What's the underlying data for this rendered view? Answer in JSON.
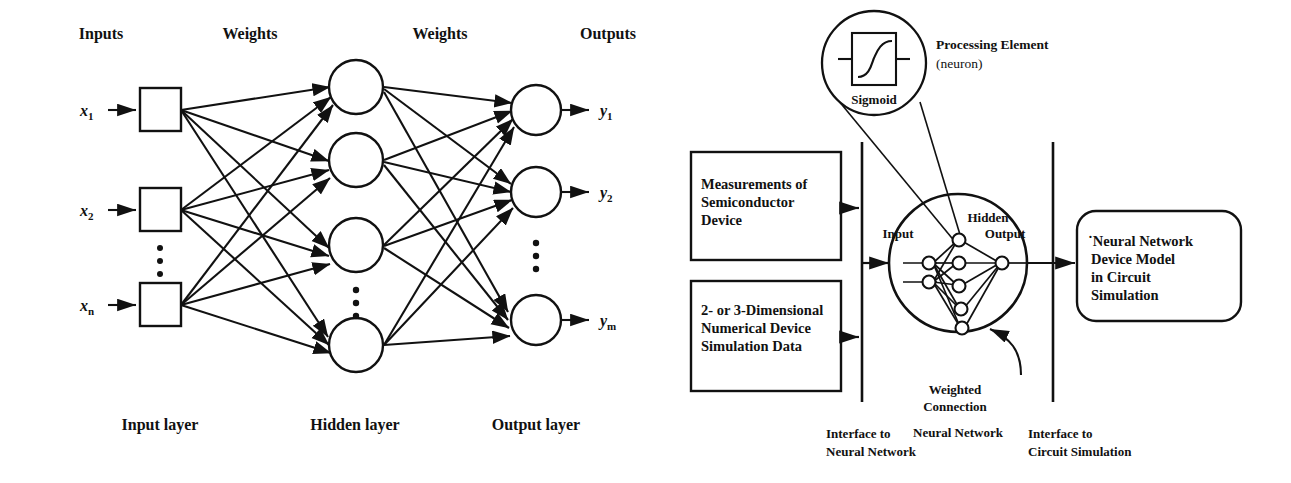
{
  "figure": {
    "left_diagram": {
      "headers": {
        "inputs": "Inputs",
        "weights_1": "Weights",
        "weights_2": "Weights",
        "outputs": "Outputs"
      },
      "input_labels": [
        {
          "base": "x",
          "sub": "1"
        },
        {
          "base": "x",
          "sub": "2"
        },
        {
          "base": "x",
          "sub": "n"
        }
      ],
      "output_labels": [
        {
          "base": "y",
          "sub": "1"
        },
        {
          "base": "y",
          "sub": "2"
        },
        {
          "base": "y",
          "sub": "m"
        }
      ],
      "layer_labels": {
        "input": "Input layer",
        "hidden": "Hidden layer",
        "output": "Output layer"
      },
      "counts": {
        "input_nodes_shown": 3,
        "hidden_nodes_shown": 4,
        "output_nodes_shown": 3
      },
      "ellipsis_marker": "vertical-dots"
    },
    "right_diagram": {
      "source_boxes": [
        {
          "lines": [
            "Measurements of",
            "Semiconductor",
            "Device"
          ]
        },
        {
          "lines": [
            "2- or 3-Dimensional",
            "Numerical Device",
            "Simulation Data"
          ]
        }
      ],
      "result_box": {
        "lines": [
          "˙Neural Network",
          "Device Model",
          "in Circuit",
          "Simulation"
        ]
      },
      "callouts": {
        "processing_element": "Processing Element",
        "processing_element_sub": "(neuron)",
        "sigmoid": "Sigmoid",
        "weighted_connection_line1": "Weighted",
        "weighted_connection_line2": "Connection"
      },
      "network_labels": {
        "input": "Input",
        "hidden": "Hidden",
        "output": "Output",
        "caption": "Neural Network"
      },
      "interfaces": [
        {
          "line1": "Interface to",
          "line2": "Neural Network"
        },
        {
          "line1": "Interface to",
          "line2": "Circuit Simulation"
        }
      ]
    },
    "colors": {
      "ink": "#111111",
      "background": "#ffffff"
    }
  }
}
